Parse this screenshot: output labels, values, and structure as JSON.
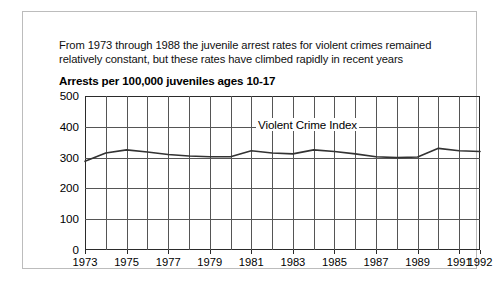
{
  "figure": {
    "caption_lines": [
      "From 1973 through 1988 the juvenile arrest rates for violent crimes remained",
      "relatively constant, but these rates have climbed rapidly in recent years"
    ],
    "subtitle": "Arrests per 100,000 juveniles ages 10-17",
    "series_label": "Violent Crime Index",
    "border_color": "#bcbcbc",
    "line_color": "#333333",
    "grid_color": "#555555"
  },
  "chart_data": {
    "type": "line",
    "title": "Arrests per 100,000 juveniles ages 10-17",
    "annotation": "Violent Crime Index",
    "xlabel": "",
    "ylabel": "",
    "xlim": [
      1973,
      1992
    ],
    "ylim": [
      0,
      500
    ],
    "yticks": [
      0,
      100,
      200,
      300,
      400,
      500
    ],
    "ytick_labels": [
      "0",
      "100",
      "200",
      "300",
      "400",
      "500"
    ],
    "xticks": [
      1973,
      1975,
      1977,
      1979,
      1981,
      1983,
      1985,
      1987,
      1989,
      1991,
      1992
    ],
    "xtick_labels": [
      "1973",
      "1975",
      "1977",
      "1979",
      "1981",
      "1983",
      "1985",
      "1987",
      "1989",
      "1991",
      "1992"
    ],
    "grid": true,
    "legend_position": "inline-annotation",
    "x": [
      1973,
      1974,
      1975,
      1976,
      1977,
      1978,
      1979,
      1980,
      1981,
      1982,
      1983,
      1984,
      1985,
      1986,
      1987,
      1988,
      1989,
      1990,
      1991,
      1992
    ],
    "series": [
      {
        "name": "Violent Crime Index",
        "values": [
          288,
          315,
          325,
          318,
          310,
          305,
          303,
          303,
          322,
          315,
          312,
          325,
          320,
          312,
          303,
          300,
          302,
          330,
          322,
          320
        ]
      }
    ],
    "values_note": "rate per 100,000 juveniles ages 10-17"
  }
}
